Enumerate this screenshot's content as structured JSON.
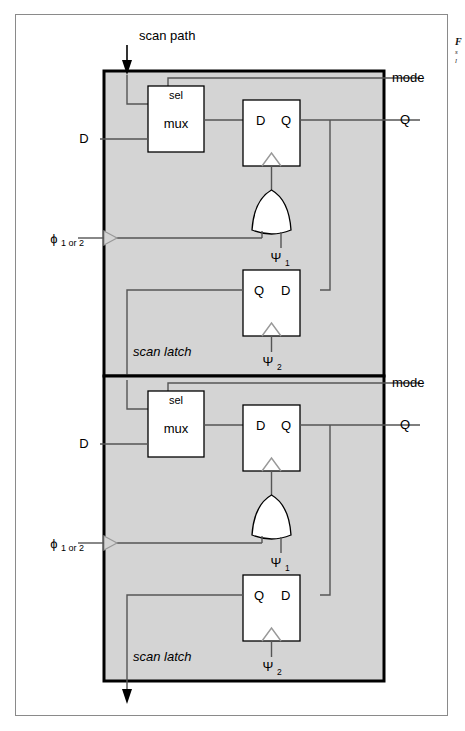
{
  "figure": {
    "outer_frame": {
      "x": 15,
      "y": 14,
      "w": 433,
      "h": 702
    },
    "fill_color": "#d4d4d4",
    "line_color": "#000000",
    "wire_color": "#555555"
  },
  "annotations": {
    "scan_path": "scan path",
    "mode": "mode",
    "d_input": "D",
    "q_output": "Q",
    "phi_main": "ϕ",
    "phi_sub": "1 or 2",
    "scan_latch": "scan latch",
    "mux": "mux",
    "sel": "sel",
    "ff_d": "D",
    "ff_q": "Q",
    "latch_q": "Q",
    "latch_d": "D",
    "psi": "Ψ",
    "psi1_sub": "1",
    "psi2_sub": "2"
  },
  "margin_caption": {
    "line1": "F",
    "line2": "s",
    "line3": "l"
  },
  "blocks": [
    {
      "name": "scan-latch-block-1",
      "index": 1,
      "label": "scan latch",
      "mode_label": "mode",
      "d_label": "D",
      "q_label": "Q",
      "phi_label": "ϕ",
      "phi_sub": "1 or 2",
      "mux_label": "mux",
      "sel_label": "sel",
      "ff_in": "D",
      "ff_out": "Q",
      "latch_in": "Q",
      "latch_out": "D",
      "clock1": "Ψ",
      "clock1_sub": "1",
      "clock2": "Ψ",
      "clock2_sub": "2"
    },
    {
      "name": "scan-latch-block-2",
      "index": 2,
      "label": "scan latch",
      "mode_label": "mode",
      "d_label": "D",
      "q_label": "Q",
      "phi_label": "ϕ",
      "phi_sub": "1 or 2",
      "mux_label": "mux",
      "sel_label": "sel",
      "ff_in": "D",
      "ff_out": "Q",
      "latch_in": "Q",
      "latch_out": "D",
      "clock1": "Ψ",
      "clock1_sub": "1",
      "clock2": "Ψ",
      "clock2_sub": "2"
    }
  ]
}
